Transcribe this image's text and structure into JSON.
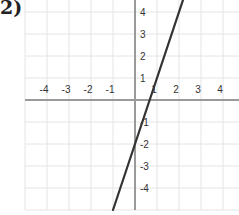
{
  "problem_label": "2)",
  "chart_data": {
    "type": "line",
    "title": "",
    "xlabel": "",
    "ylabel": "",
    "xlim": [
      -5,
      4.8
    ],
    "ylim": [
      -5,
      4.6
    ],
    "grid": true,
    "x_ticks": [
      "-4",
      "-3",
      "-2",
      "-1",
      "1",
      "2",
      "3",
      "4"
    ],
    "y_ticks": [
      "4",
      "3",
      "2",
      "1",
      "-1",
      "-2",
      "-3",
      "-4"
    ],
    "series": [
      {
        "name": "y = 3x - 2",
        "equation": "y = 3x - 2",
        "x": [
          -1,
          2.2
        ],
        "y": [
          -5,
          4.6
        ],
        "color": "#333333"
      }
    ],
    "colors": {
      "grid": "#e4e4e4",
      "axis": "#9a9a9a",
      "line": "#333333"
    }
  }
}
